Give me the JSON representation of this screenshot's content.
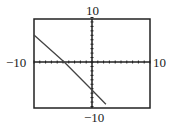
{
  "chart_data": {
    "type": "line",
    "title": "",
    "xlabel": "",
    "ylabel": "",
    "xlim": [
      -10,
      10
    ],
    "ylim": [
      -10,
      10
    ],
    "grid": false,
    "tick_labels": {
      "x_min": "−10",
      "x_max": "10",
      "y_min": "−10",
      "y_max": "10"
    },
    "series": [
      {
        "name": "line",
        "x": [
          -10,
          -4.8,
          0,
          2.4
        ],
        "y": [
          6.1,
          0,
          -6.3,
          -9.5
        ]
      }
    ],
    "colors": {
      "line": "#444444",
      "axes": "#222222",
      "frame": "#222222"
    }
  }
}
